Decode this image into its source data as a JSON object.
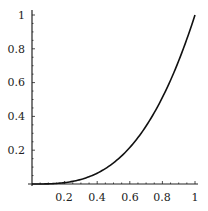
{
  "chart_data": {
    "type": "line",
    "title": "",
    "xlabel": "",
    "ylabel": "",
    "xlim": [
      0,
      1
    ],
    "ylim": [
      0,
      1
    ],
    "grid": false,
    "legend": null,
    "x_ticks": [
      "0.2",
      "0.4",
      "0.6",
      "0.8",
      "1"
    ],
    "y_ticks": [
      "0.2",
      "0.4",
      "0.6",
      "0.8",
      "1"
    ],
    "series": [
      {
        "name": "y = x^3",
        "x": [
          0,
          0.1,
          0.2,
          0.3,
          0.4,
          0.5,
          0.6,
          0.7,
          0.8,
          0.9,
          1.0
        ],
        "y": [
          0,
          0.001,
          0.008,
          0.027,
          0.064,
          0.125,
          0.216,
          0.343,
          0.512,
          0.729,
          1.0
        ]
      }
    ]
  },
  "colors": {
    "line": "#111111",
    "axis": "#222222",
    "background": "#ffffff"
  }
}
